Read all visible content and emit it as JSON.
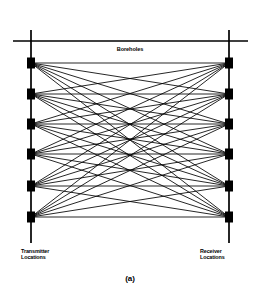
{
  "figure": {
    "caption": "(a)",
    "surface_label": "Boreholes",
    "left_label_line1": "Transmitter",
    "left_label_line2": "Locations",
    "right_label_line1": "Receiver",
    "right_label_line2": "Locations",
    "ink_color": "#000000",
    "background_color": "#ffffff"
  },
  "chart_data": {
    "type": "scatter",
    "title": "Boreholes",
    "xlabel": "",
    "ylabel": "",
    "xlim": [
      0,
      260
    ],
    "ylim": [
      0,
      299
    ],
    "grid": false,
    "legend": "none",
    "annotations": [
      {
        "text": "Boreholes",
        "x": 130,
        "y": 52
      },
      {
        "text": "Transmitter Locations",
        "x": 21,
        "y": 252
      },
      {
        "text": "Receiver Locations",
        "x": 200,
        "y": 252
      },
      {
        "text": "(a)",
        "x": 130,
        "y": 280
      }
    ],
    "surface_line": {
      "x1": 13,
      "y1": 41,
      "x2": 248,
      "y2": 41
    },
    "boreholes": [
      {
        "name": "transmitter-borehole",
        "x": 31,
        "y_top": 30,
        "y_bottom": 243
      },
      {
        "name": "receiver-borehole",
        "x": 229,
        "y_top": 30,
        "y_bottom": 243
      }
    ],
    "series": [
      {
        "name": "Transmitter Locations",
        "marker": "filled-rectangle",
        "x": [
          31,
          31,
          31,
          31,
          31,
          31
        ],
        "y": [
          63,
          94,
          124,
          154,
          186,
          217
        ]
      },
      {
        "name": "Receiver Locations",
        "marker": "filled-rectangle",
        "x": [
          229,
          229,
          229,
          229,
          229,
          229
        ],
        "y": [
          63,
          94,
          124,
          154,
          186,
          217
        ]
      }
    ],
    "ray_paths": {
      "description": "Every transmitter connected to every receiver",
      "count": 36
    }
  }
}
